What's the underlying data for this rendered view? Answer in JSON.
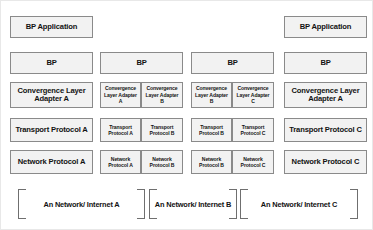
{
  "diagram": {
    "colors": {
      "box_fill": "#f2f2f2",
      "box_border": "#8a8a8a",
      "bracket_border": "#6f6f6f",
      "text": "#121212",
      "background": "#ffffff"
    },
    "stacks": [
      {
        "id": "stack-1",
        "role": "source-host",
        "application": "BP Application",
        "bp": "BP",
        "convergence_layer": [
          "Convergence Layer Adapter A"
        ],
        "transport": [
          "Transport Protocol A"
        ],
        "network": [
          "Network Protocol A"
        ]
      },
      {
        "id": "stack-2",
        "role": "gateway-ab",
        "application": null,
        "bp": "BP",
        "convergence_layer": [
          "Convergence Layer Adapter A",
          "Convergence Layer Adapter B"
        ],
        "transport": [
          "Transport Protocol A",
          "Transport Protocol B"
        ],
        "network": [
          "Network Protocol A",
          "Network Protocol B"
        ]
      },
      {
        "id": "stack-3",
        "role": "gateway-bc",
        "application": null,
        "bp": "BP",
        "convergence_layer": [
          "Convergence Layer Adapter B",
          "Convergence Layer Adapter C"
        ],
        "transport": [
          "Transport Protocol B",
          "Transport Protocol C"
        ],
        "network": [
          "Network Protocol B",
          "Network Protocol C"
        ]
      },
      {
        "id": "stack-4",
        "role": "destination-host",
        "application": "BP Application",
        "bp": "BP",
        "convergence_layer": [
          "Convergence Layer Adapter A"
        ],
        "transport": [
          "Transport Protocol C"
        ],
        "network": [
          "Network Protocol C"
        ]
      }
    ],
    "networks": [
      "An Network/ Internet A",
      "An Network/ Internet B",
      "An Network/ Internet C"
    ]
  }
}
